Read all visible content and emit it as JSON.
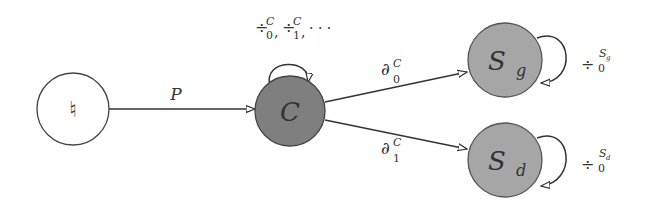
{
  "diagram": {
    "type": "state-diagram",
    "colors": {
      "node_fill": "#808080",
      "node_fill_light": "#a8a8a8",
      "stroke": "#333333",
      "start_fill": "#ffffff"
    },
    "nodes": [
      {
        "id": "start",
        "label": "♮"
      },
      {
        "id": "C",
        "label": "C"
      },
      {
        "id": "Sg",
        "label_main": "S",
        "label_sub": "g"
      },
      {
        "id": "Sd",
        "label_main": "S",
        "label_sub": "d"
      }
    ],
    "edges": [
      {
        "from": "start",
        "to": "C",
        "label": "P"
      },
      {
        "from": "C",
        "to": "C",
        "label": "÷₀ᶜ, ÷₁ᶜ, ⋯",
        "label_parts": {
          "op": "÷",
          "sup": "C",
          "sub0": "0",
          "sub1": "1",
          "ellipsis": "· · ·"
        }
      },
      {
        "from": "C",
        "to": "Sg",
        "label_parts": {
          "op": "∂",
          "sup": "C",
          "sub": "0"
        }
      },
      {
        "from": "C",
        "to": "Sd",
        "label_parts": {
          "op": "∂",
          "sup": "C",
          "sub": "1"
        }
      },
      {
        "from": "Sg",
        "to": "Sg",
        "label_parts": {
          "op": "÷",
          "sup": "S",
          "supsub": "g",
          "sub": "0"
        }
      },
      {
        "from": "Sd",
        "to": "Sd",
        "label_parts": {
          "op": "÷",
          "sup": "S",
          "supsub": "d",
          "sub": "0"
        }
      }
    ]
  }
}
